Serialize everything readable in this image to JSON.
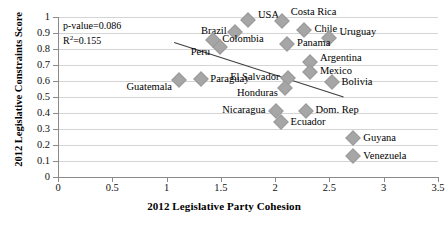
{
  "chart_data": {
    "type": "scatter",
    "title": "",
    "xlabel": "2012 Legislative Party Cohesion",
    "ylabel": "2012 Legislative Constraints Score",
    "xlim": [
      0,
      3.5
    ],
    "ylim": [
      0,
      1
    ],
    "xticks": [
      "0",
      "0.5",
      "1",
      "1.5",
      "2",
      "2.5",
      "3",
      "3.5"
    ],
    "yticks": [
      "0",
      "0.1",
      "0.2",
      "0.3",
      "0.4",
      "0.5",
      "0.6",
      "0.7",
      "0.8",
      "0.9",
      "1"
    ],
    "grid": "horizontal",
    "legend": "none",
    "marker_color": "#a6a6a6",
    "trendline": {
      "x0": 1.07,
      "y0": 0.84,
      "x1": 2.63,
      "y1": 0.5,
      "color": "#3f3f3f"
    },
    "annotations": {
      "p_value": "p-value=0.086",
      "r_squared_prefix": "R",
      "r_squared_sup": "2",
      "r_squared_value": "=0.155"
    },
    "points": [
      {
        "label": "USA",
        "x": 1.75,
        "y": 0.982,
        "lx": 10,
        "ly": -5
      },
      {
        "label": "Costa Rica",
        "x": 2.06,
        "y": 0.975,
        "lx": 9,
        "ly": -9
      },
      {
        "label": "Brazil",
        "x": 1.63,
        "y": 0.907,
        "lx": -34,
        "ly": -1
      },
      {
        "label": "Chile",
        "x": 2.27,
        "y": 0.919,
        "lx": 10,
        "ly": -1
      },
      {
        "label": "Colombia",
        "x": 1.43,
        "y": 0.857,
        "lx": 9,
        "ly": -1
      },
      {
        "label": "Uruguay",
        "x": 2.5,
        "y": 0.869,
        "lx": 10,
        "ly": -6
      },
      {
        "label": "Panama",
        "x": 2.11,
        "y": 0.832,
        "lx": 10,
        "ly": -1
      },
      {
        "label": "Peru",
        "x": 1.49,
        "y": 0.813,
        "lx": -29,
        "ly": 5
      },
      {
        "label": "Argentina",
        "x": 2.32,
        "y": 0.719,
        "lx": 10,
        "ly": -4
      },
      {
        "label": "Mexico",
        "x": 2.32,
        "y": 0.656,
        "lx": 10,
        "ly": -1
      },
      {
        "label": "El Salvador",
        "x": 2.12,
        "y": 0.619,
        "lx": -58,
        "ly": -1
      },
      {
        "label": "Paraguay",
        "x": 1.32,
        "y": 0.613,
        "lx": 9,
        "ly": 0
      },
      {
        "label": "Guatemala",
        "x": 1.11,
        "y": 0.606,
        "lx": -52,
        "ly": 7
      },
      {
        "label": "Bolivia",
        "x": 2.52,
        "y": 0.594,
        "lx": 10,
        "ly": 0
      },
      {
        "label": "Honduras",
        "x": 2.09,
        "y": 0.556,
        "lx": -48,
        "ly": 5
      },
      {
        "label": "Nicaragua",
        "x": 2.01,
        "y": 0.413,
        "lx": -54,
        "ly": -1
      },
      {
        "label": "Dom. Rep",
        "x": 2.28,
        "y": 0.413,
        "lx": 10,
        "ly": -1
      },
      {
        "label": "Ecuador",
        "x": 2.05,
        "y": 0.344,
        "lx": 10,
        "ly": 0
      },
      {
        "label": "Guyana",
        "x": 2.72,
        "y": 0.244,
        "lx": 10,
        "ly": 0
      },
      {
        "label": "Venezuela",
        "x": 2.72,
        "y": 0.131,
        "lx": 10,
        "ly": 0
      }
    ]
  }
}
